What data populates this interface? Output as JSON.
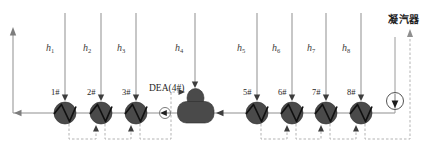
{
  "diagram": {
    "condenser_label": "凝汽器",
    "deaerator_label": "DEA(4#)",
    "extraction_labels": [
      {
        "base": "h",
        "sub": "1"
      },
      {
        "base": "h",
        "sub": "2"
      },
      {
        "base": "h",
        "sub": "3"
      },
      {
        "base": "h",
        "sub": "4"
      },
      {
        "base": "h",
        "sub": "5"
      },
      {
        "base": "h",
        "sub": "6"
      },
      {
        "base": "h",
        "sub": "7"
      },
      {
        "base": "h",
        "sub": "8"
      }
    ],
    "heater_labels": [
      "1#",
      "2#",
      "3#",
      "5#",
      "6#",
      "7#",
      "8#"
    ],
    "colors": {
      "pipe": "#8f8f8f",
      "drain_dash": "#b3b3b3",
      "vessel_fill": "#4a4a4a",
      "arrow_dark": "#3d3d3d",
      "label_text": "#1f1f1f"
    }
  }
}
